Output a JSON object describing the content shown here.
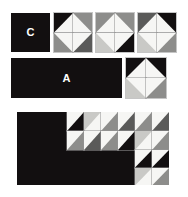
{
  "figure": {
    "background_color": "#ffffff",
    "palette": {
      "black": "#120f10",
      "white": "#f6f6f4",
      "light_gray": "#c9c9c6",
      "mid_gray": "#8d8d8b",
      "dark_gray": "#5a5a59",
      "grid_line": "#9a9a9a",
      "label_text": "#ffffff"
    },
    "labels": [
      {
        "id": "label-c",
        "text": "C"
      },
      {
        "id": "label-a",
        "text": "A"
      }
    ],
    "rows": [
      {
        "id": "row-top",
        "parts": [
          {
            "id": "panel-c",
            "kind": "panel",
            "label": "C"
          },
          {
            "id": "block-1",
            "kind": "block",
            "cols": 2,
            "rows": 2
          },
          {
            "id": "block-2",
            "kind": "block",
            "cols": 2,
            "rows": 2
          },
          {
            "id": "block-3",
            "kind": "block",
            "cols": 2,
            "rows": 2
          }
        ]
      },
      {
        "id": "row-middle",
        "parts": [
          {
            "id": "panel-a",
            "kind": "panel",
            "label": "A"
          },
          {
            "id": "block-4",
            "kind": "block",
            "cols": 2,
            "rows": 2
          }
        ]
      },
      {
        "id": "row-bottom",
        "parts": [
          {
            "id": "composite",
            "kind": "composite"
          }
        ]
      }
    ]
  },
  "blocks": {
    "block-1": {
      "name": "two-by-two-unit-1",
      "cols": 2,
      "rows": 2,
      "cells": [
        {
          "orientation": "tl",
          "tri": "black",
          "bg": "white"
        },
        {
          "orientation": "tr",
          "tri": "mid_gray",
          "bg": "white"
        },
        {
          "orientation": "bl",
          "tri": "mid_gray",
          "bg": "white"
        },
        {
          "orientation": "br",
          "tri": "dark_gray",
          "bg": "white"
        }
      ]
    },
    "block-2": {
      "name": "two-by-two-unit-2",
      "cols": 2,
      "rows": 2,
      "cells": [
        {
          "orientation": "tl",
          "tri": "mid_gray",
          "bg": "white"
        },
        {
          "orientation": "tr",
          "tri": "mid_gray",
          "bg": "white"
        },
        {
          "orientation": "bl",
          "tri": "light_gray",
          "bg": "white"
        },
        {
          "orientation": "br",
          "tri": "black",
          "bg": "white"
        }
      ]
    },
    "block-3": {
      "name": "two-by-two-unit-3",
      "cols": 2,
      "rows": 2,
      "cells": [
        {
          "orientation": "tl",
          "tri": "dark_gray",
          "bg": "white"
        },
        {
          "orientation": "tr",
          "tri": "black",
          "bg": "white"
        },
        {
          "orientation": "bl",
          "tri": "light_gray",
          "bg": "white"
        },
        {
          "orientation": "br",
          "tri": "mid_gray",
          "bg": "white"
        }
      ]
    },
    "block-4": {
      "name": "two-by-two-unit-4",
      "cols": 2,
      "rows": 2,
      "cells": [
        {
          "orientation": "tl",
          "tri": "black",
          "bg": "white"
        },
        {
          "orientation": "tr",
          "tri": "black",
          "bg": "white"
        },
        {
          "orientation": "bl",
          "tri": "light_gray",
          "bg": "white"
        },
        {
          "orientation": "br",
          "tri": "mid_gray",
          "bg": "white"
        }
      ]
    },
    "composite-top": {
      "name": "composite-upper-band",
      "cols": 6,
      "rows": 2,
      "cells": [
        {
          "orientation": "tl",
          "tri": "white",
          "bg": "black"
        },
        {
          "orientation": "tl",
          "tri": "light_gray",
          "bg": "white"
        },
        {
          "orientation": "tl",
          "tri": "white",
          "bg": "mid_gray"
        },
        {
          "orientation": "tl",
          "tri": "white",
          "bg": "dark_gray"
        },
        {
          "orientation": "tl",
          "tri": "white",
          "bg": "mid_gray"
        },
        {
          "orientation": "tl",
          "tri": "white",
          "bg": "dark_gray"
        },
        {
          "orientation": "tl",
          "tri": "white",
          "bg": "mid_gray"
        },
        {
          "orientation": "tl",
          "tri": "white",
          "bg": "dark_gray"
        },
        {
          "orientation": "tl",
          "tri": "white",
          "bg": "mid_gray"
        },
        {
          "orientation": "tl",
          "tri": "white",
          "bg": "black"
        },
        {
          "orientation": "tl",
          "tri": "light_gray",
          "bg": "white"
        },
        {
          "orientation": "tl",
          "tri": "white",
          "bg": "mid_gray"
        }
      ]
    },
    "composite-bottom": {
      "name": "composite-lower-corner",
      "cols": 2,
      "rows": 2,
      "cells": [
        {
          "orientation": "tl",
          "tri": "white",
          "bg": "black"
        },
        {
          "orientation": "tl",
          "tri": "white",
          "bg": "black"
        },
        {
          "orientation": "tl",
          "tri": "light_gray",
          "bg": "white"
        },
        {
          "orientation": "tl",
          "tri": "white",
          "bg": "mid_gray"
        }
      ]
    }
  },
  "geometry": {
    "panel_c": {
      "x": 11,
      "y": 13,
      "w": 39,
      "h": 39
    },
    "block_1": {
      "x": 54,
      "y": 13,
      "w": 38,
      "h": 39
    },
    "block_2": {
      "x": 96,
      "y": 13,
      "w": 38,
      "h": 39
    },
    "block_3": {
      "x": 138,
      "y": 13,
      "w": 38,
      "h": 39
    },
    "panel_a": {
      "x": 11,
      "y": 58,
      "w": 111,
      "h": 40
    },
    "block_4": {
      "x": 126,
      "y": 58,
      "w": 40,
      "h": 40
    },
    "composite": {
      "x": 17,
      "y": 112,
      "w": 152,
      "h": 73
    },
    "composite_top_block": {
      "x": 50,
      "y": 0,
      "w": 102,
      "h": 38
    },
    "composite_bottom_block": {
      "x": 118,
      "y": 38,
      "w": 34,
      "h": 35
    }
  }
}
